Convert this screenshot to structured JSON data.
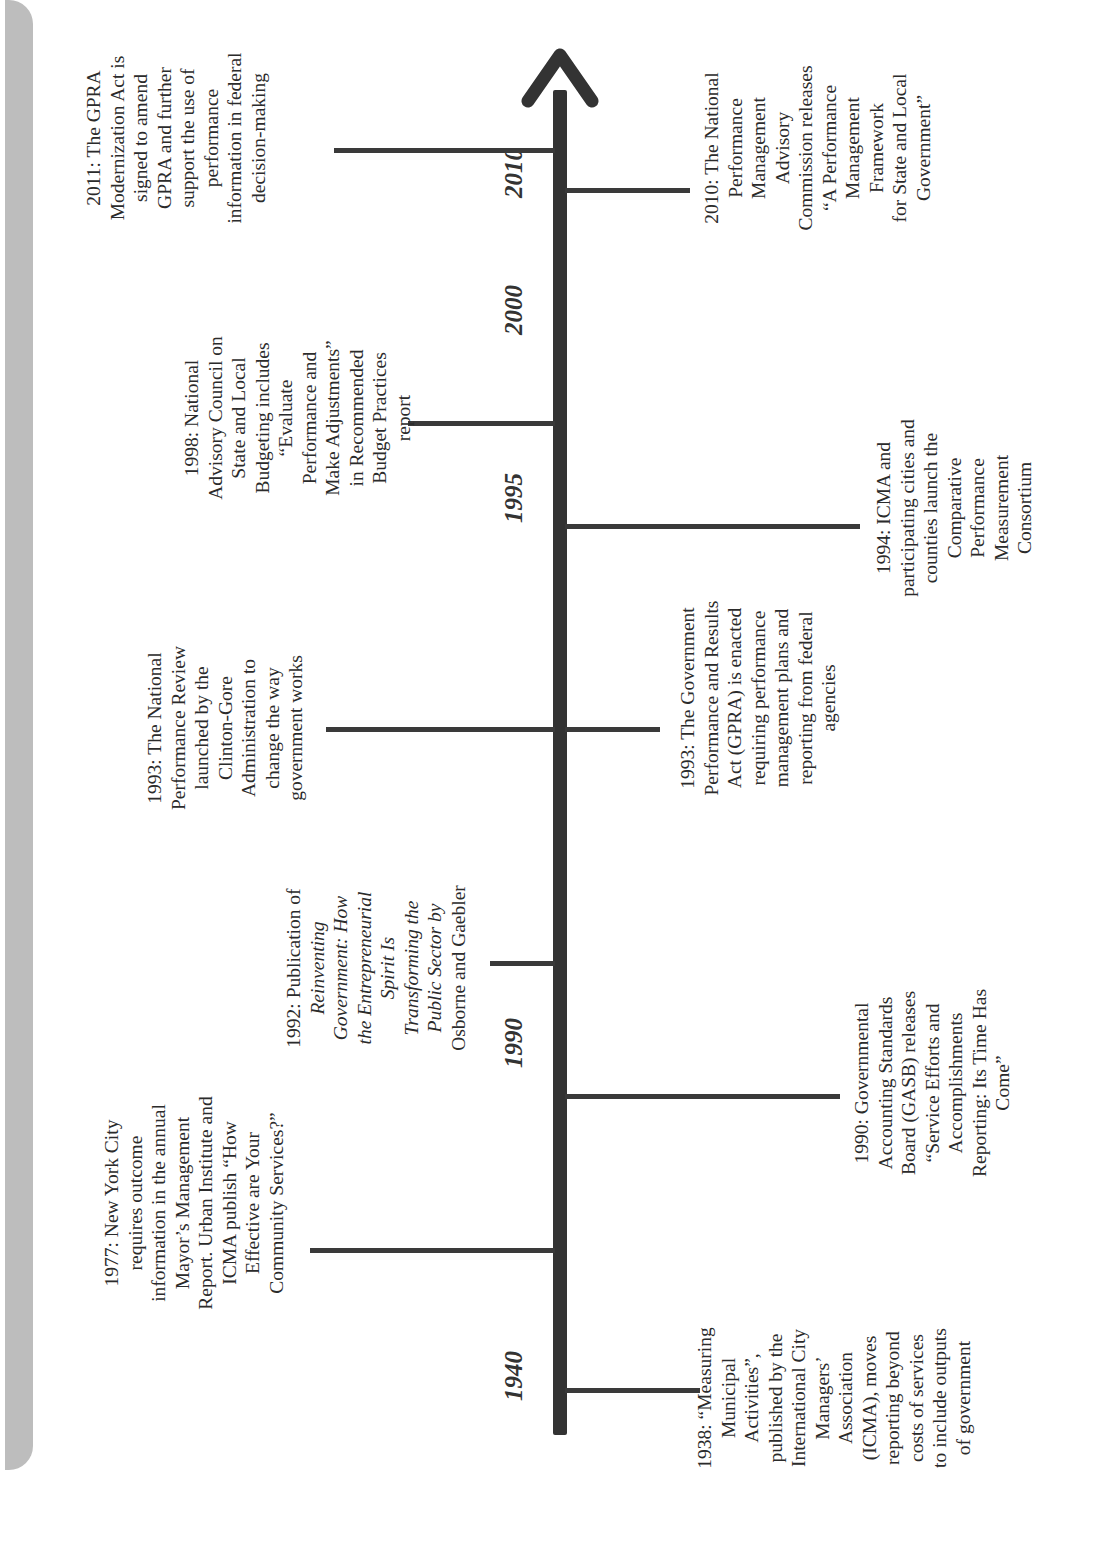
{
  "timeline": {
    "orientation": "rotated-90-ccw",
    "axis_color": "#333333",
    "sidebar_color": "#bdbdbd",
    "year_labels": [
      "1940",
      "1990",
      "1995",
      "2000",
      "2010"
    ],
    "events_above": [
      {
        "year": "1977",
        "lines": [
          "1977: New York City",
          "requires outcome",
          "information in the annual",
          "Mayor’s Management",
          "Report. Urban Institute and",
          "ICMA publish “How",
          "Effective are Your",
          "Community Services?”"
        ]
      },
      {
        "year": "1992",
        "lines": [
          "1992: Publication of",
          "Reinventing",
          "Government: How",
          "the Entrepreneurial",
          "Spirit Is",
          "Transforming the",
          "Public Sector by",
          "Osborne and Gaebler"
        ]
      },
      {
        "year": "1993",
        "lines": [
          "1993: The National",
          "Performance Review",
          "launched by the",
          "Clinton-Gore",
          "Administration to",
          "change the way",
          "government works"
        ]
      },
      {
        "year": "1998",
        "lines": [
          "1998: National",
          "Advisory Council on",
          "State and Local",
          "Budgeting includes",
          "“Evaluate",
          "Performance and",
          "Make Adjustments”",
          "in Recommended",
          "Budget Practices",
          "report"
        ]
      },
      {
        "year": "2011",
        "lines": [
          "2011: The GPRA",
          "Modernization Act is",
          "signed to amend",
          "GPRA and further",
          "support the use of",
          "performance",
          "information in federal",
          "decision-making"
        ]
      }
    ],
    "events_below": [
      {
        "year": "1938",
        "lines": [
          "1938: “Measuring",
          "Municipal",
          "Activities”,",
          "published by the",
          "International City",
          "Managers’",
          "Association",
          "(ICMA), moves",
          "reporting beyond",
          "costs of services",
          "to include outputs",
          "of government"
        ]
      },
      {
        "year": "1990",
        "lines": [
          "1990: Governmental",
          "Accounting Standards",
          "Board (GASB) releases",
          "“Service Efforts and",
          "Accomplishments",
          "Reporting: Its Time Has",
          "Come”"
        ]
      },
      {
        "year": "1993",
        "lines": [
          "1993: The Government",
          "Performance and Results",
          "Act (GPRA) is enacted",
          "requiring performance",
          "management plans and",
          "reporting from federal",
          "agencies"
        ]
      },
      {
        "year": "1994",
        "lines": [
          "1994: ICMA and",
          "participating cities and",
          "counties launch the",
          "Comparative",
          "Performance",
          "Measurement",
          "Consortium"
        ]
      },
      {
        "year": "2010",
        "lines": [
          "2010: The National",
          "Performance",
          "Management",
          "Advisory",
          "Commission releases",
          "“A Performance",
          "Management",
          "Framework",
          "for State and Local",
          "Government”"
        ]
      }
    ]
  }
}
